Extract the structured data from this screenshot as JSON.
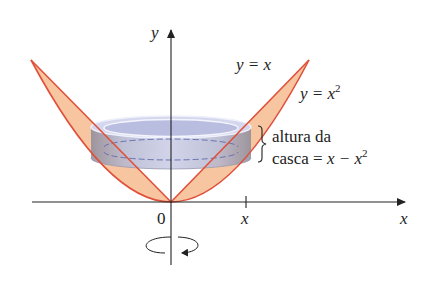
{
  "diagram": {
    "type": "solid-of-revolution-shell",
    "axes": {
      "x_label": "x",
      "y_label": "y",
      "origin_label": "0",
      "tick_label": "x"
    },
    "curves": [
      {
        "name": "line",
        "label_lhs": "y = x",
        "label": "y = x"
      },
      {
        "name": "parabola",
        "label_base": "y = x",
        "label_exp": "2"
      }
    ],
    "annotation": {
      "line1": "altura da",
      "line2_prefix": "casca = ",
      "line2_math": "x − x",
      "line2_exp": "2"
    },
    "rotation_arrow": "rotation-about-y-axis",
    "colors": {
      "region_fill": "#f7c39c",
      "curve_stroke": "#e0503a",
      "shell_fill": "#c7cbe6",
      "shell_side": "#8a8aa0",
      "axis": "#222222"
    }
  }
}
